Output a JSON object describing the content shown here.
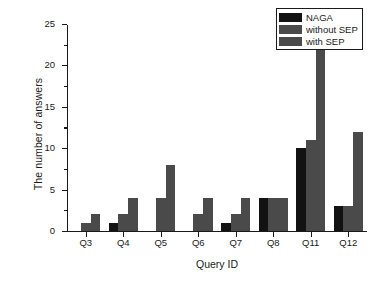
{
  "chart_data": {
    "type": "bar",
    "title": "",
    "xlabel": "Query ID",
    "ylabel": "The number of answers",
    "categories": [
      "Q3",
      "Q4",
      "Q5",
      "Q6",
      "Q7",
      "Q8",
      "Q11",
      "Q12"
    ],
    "series": [
      {
        "name": "NAGA",
        "color": "#121212",
        "values": [
          0,
          1,
          0,
          0,
          1,
          4,
          10,
          3
        ]
      },
      {
        "name": "without SEP",
        "color": "#4a4a4a",
        "values": [
          1,
          2,
          4,
          2,
          2,
          4,
          11,
          3
        ]
      },
      {
        "name": "with SEP",
        "color": "#4a4a4a",
        "values": [
          2,
          4,
          8,
          4,
          4,
          4,
          22,
          12
        ]
      }
    ],
    "ylim": [
      0,
      25
    ],
    "yticks": [
      0,
      5,
      10,
      15,
      20,
      25
    ],
    "ytick_labels": [
      "0",
      "5",
      "10",
      "15",
      "20",
      "25"
    ],
    "yminor_interval": 2.5,
    "grid": false,
    "legend_position": "top-right"
  },
  "legend": {
    "entries": [
      {
        "label": "NAGA"
      },
      {
        "label": "without SEP"
      },
      {
        "label": "with SEP"
      }
    ]
  }
}
